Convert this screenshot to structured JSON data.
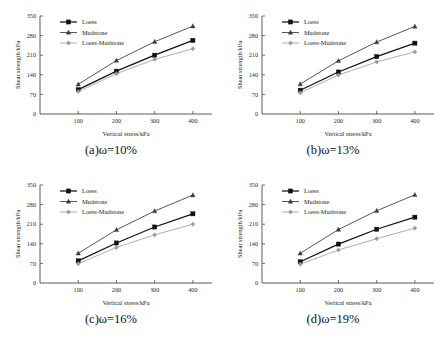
{
  "figure": {
    "series_names": [
      "Loess",
      "Mudstone",
      "Loess-Mudstone"
    ],
    "x_axis_title": "Vertical stress/kPa",
    "y_axis_title": "Shear strength/kPa",
    "x_ticks": [
      "0",
      "100",
      "200",
      "300",
      "400"
    ],
    "y_ticks": [
      "0",
      "70",
      "140",
      "210",
      "280",
      "350"
    ],
    "captions": {
      "a": "(a)ω=10%",
      "b": "(b)ω=13%",
      "c": "(c)ω=16%",
      "d": "(d)ω=19%"
    },
    "colors": {
      "loess": "#111111",
      "mudstone": "#3a3a3a",
      "loess_mudstone": "#9a9a9a",
      "axis": "#4a4a4a"
    }
  },
  "chart_data": [
    {
      "type": "line",
      "title": "(a)ω=10%",
      "xlabel": "Vertical stress/kPa",
      "ylabel": "Shear strength/kPa",
      "x": [
        100,
        200,
        300,
        400
      ],
      "xlim": [
        0,
        450
      ],
      "ylim": [
        0,
        350
      ],
      "xticks": [
        0,
        100,
        200,
        300,
        400
      ],
      "yticks": [
        0,
        70,
        140,
        210,
        280,
        350
      ],
      "grid": false,
      "legend_position": "upper-left",
      "series": [
        {
          "name": "Loess",
          "values": [
            87,
            153,
            210,
            263
          ]
        },
        {
          "name": "Mudstone",
          "values": [
            106,
            191,
            258,
            314
          ]
        },
        {
          "name": "Loess-Mudstone",
          "values": [
            80,
            144,
            195,
            233
          ]
        }
      ]
    },
    {
      "type": "line",
      "title": "(b)ω=13%",
      "xlabel": "Vertical stress/kPa",
      "ylabel": "Shear strength/kPa",
      "x": [
        100,
        200,
        300,
        400
      ],
      "xlim": [
        0,
        450
      ],
      "ylim": [
        0,
        350
      ],
      "xticks": [
        0,
        100,
        200,
        300,
        400
      ],
      "yticks": [
        0,
        70,
        140,
        210,
        280,
        350
      ],
      "grid": false,
      "legend_position": "upper-left",
      "series": [
        {
          "name": "Loess",
          "values": [
            85,
            150,
            205,
            253
          ]
        },
        {
          "name": "Mudstone",
          "values": [
            107,
            190,
            257,
            313
          ]
        },
        {
          "name": "Loess-Mudstone",
          "values": [
            76,
            139,
            186,
            222
          ]
        }
      ]
    },
    {
      "type": "line",
      "title": "(c)ω=16%",
      "xlabel": "Vertical stress/kPa",
      "ylabel": "Shear strength/kPa",
      "x": [
        100,
        200,
        300,
        400
      ],
      "xlim": [
        0,
        450
      ],
      "ylim": [
        0,
        350
      ],
      "xticks": [
        0,
        100,
        200,
        300,
        400
      ],
      "yticks": [
        0,
        70,
        140,
        210,
        280,
        350
      ],
      "grid": false,
      "legend_position": "upper-left",
      "series": [
        {
          "name": "Loess",
          "values": [
            79,
            143,
            200,
            247
          ]
        },
        {
          "name": "Mudstone",
          "values": [
            106,
            190,
            257,
            314
          ]
        },
        {
          "name": "Loess-Mudstone",
          "values": [
            69,
            127,
            172,
            210
          ]
        }
      ]
    },
    {
      "type": "line",
      "title": "(d)ω=19%",
      "xlabel": "Vertical stress/kPa",
      "ylabel": "Shear strength/kPa",
      "x": [
        100,
        200,
        300,
        400
      ],
      "xlim": [
        0,
        450
      ],
      "ylim": [
        0,
        350
      ],
      "xticks": [
        0,
        100,
        200,
        300,
        400
      ],
      "yticks": [
        0,
        70,
        140,
        210,
        280,
        350
      ],
      "grid": false,
      "legend_position": "upper-left",
      "series": [
        {
          "name": "Loess",
          "values": [
            76,
            139,
            192,
            235
          ]
        },
        {
          "name": "Mudstone",
          "values": [
            106,
            191,
            258,
            315
          ]
        },
        {
          "name": "Loess-Mudstone",
          "values": [
            67,
            118,
            158,
            196
          ]
        }
      ]
    }
  ]
}
